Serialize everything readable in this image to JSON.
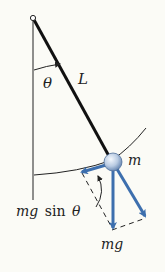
{
  "diagram": {
    "labels": {
      "angle": "θ",
      "length": "L",
      "mass": "m",
      "weight": "mg",
      "tangential_prefix": "mg",
      "tangential_func": "sin",
      "tangential_angle": "θ"
    },
    "colors": {
      "background": "#fbfbf6",
      "line": "#222222",
      "vector": "#3d6fae",
      "bob_light": "#e6eef8",
      "bob_dark": "#6f8fb8"
    }
  }
}
